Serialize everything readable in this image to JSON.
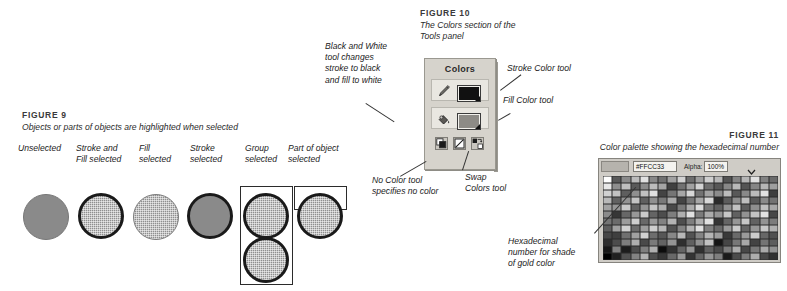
{
  "figure9": {
    "title": "FIGURE 9",
    "caption": "Objects or parts of objects are highlighted when selected",
    "columns": [
      {
        "label_line1": "Unselected",
        "label_line2": ""
      },
      {
        "label_line1": "Stroke and",
        "label_line2": "Fill selected"
      },
      {
        "label_line1": "Fill",
        "label_line2": "selected"
      },
      {
        "label_line1": "Stroke",
        "label_line2": "selected"
      },
      {
        "label_line1": "Group",
        "label_line2": "selected"
      },
      {
        "label_line1": "Part of object",
        "label_line2": "selected"
      }
    ]
  },
  "figure10": {
    "title": "FIGURE 10",
    "caption_line1": "The Colors section of the",
    "caption_line2": "Tools panel",
    "panel": {
      "title": "Colors",
      "stroke_icon": "pencil-icon",
      "stroke_color": "#111111",
      "fill_icon": "paint-bucket-icon",
      "fill_color": "#8d8b86",
      "buttons": [
        {
          "name": "black-and-white-tool"
        },
        {
          "name": "no-color-tool"
        },
        {
          "name": "swap-colors-tool"
        }
      ]
    },
    "callouts": {
      "black_white": "Black and White\ntool changes\nstroke to black\nand fill to white",
      "stroke_color_tool": "Stroke Color tool",
      "fill_color_tool": "Fill Color tool",
      "no_color_tool": "No Color tool\nspecifies no color",
      "swap_colors_tool": "Swap\nColors tool"
    }
  },
  "figure11": {
    "title": "FIGURE 11",
    "caption": "Color palette showing the hexadecimal number",
    "toolbar": {
      "hex_value": "#FFCC33",
      "alpha_label": "Alpha:",
      "alpha_value": "100%",
      "dropdown_icon": "chevron-down-icon",
      "no_color_icon": "no-color-icon",
      "color_wheel_icon": "color-wheel-icon"
    },
    "callout": "Hexadecimal\nnumber for shade\nof gold color"
  }
}
